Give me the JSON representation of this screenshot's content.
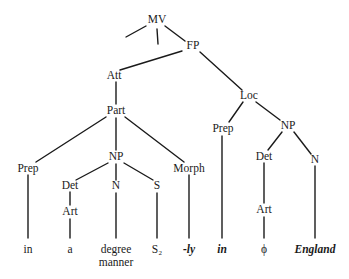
{
  "diagram": {
    "type": "syntax-tree",
    "nodes": {
      "mv": "MV",
      "fp": "FP",
      "att": "Att",
      "part": "Part",
      "loc": "Loc",
      "prep_left": "Prep",
      "np_mid": "NP",
      "morph": "Morph",
      "det_left": "Det",
      "art_left": "Art",
      "n_mid": "N",
      "s_mid": "S",
      "prep_right": "Prep",
      "np_right": "NP",
      "det_right": "Det",
      "n_right": "N",
      "art_right": "Art"
    },
    "leaves": {
      "in_left": "in",
      "a": "a",
      "degree": "degree",
      "manner": "manner",
      "s2": "S₂",
      "ly": "-ly",
      "in_right": "in",
      "phi": "ϕ",
      "england": "England"
    },
    "edges": [
      [
        "MV",
        "(left stub)"
      ],
      [
        "MV",
        "(mid stub)"
      ],
      [
        "MV",
        "FP"
      ],
      [
        "FP",
        "Att"
      ],
      [
        "FP",
        "Loc"
      ],
      [
        "Att",
        "Part"
      ],
      [
        "Part",
        "Prep"
      ],
      [
        "Part",
        "NP"
      ],
      [
        "Part",
        "Morph"
      ],
      [
        "NP",
        "Det"
      ],
      [
        "NP",
        "N"
      ],
      [
        "NP",
        "S"
      ],
      [
        "Det",
        "Art"
      ],
      [
        "Art",
        "a"
      ],
      [
        "Prep",
        "in"
      ],
      [
        "N",
        "degree manner"
      ],
      [
        "S",
        "S₂"
      ],
      [
        "Morph",
        "-ly"
      ],
      [
        "Loc",
        "Prep"
      ],
      [
        "Loc",
        "NP"
      ],
      [
        "Prep",
        "in"
      ],
      [
        "NP",
        "Det"
      ],
      [
        "NP",
        "N"
      ],
      [
        "Det",
        "Art"
      ],
      [
        "Art",
        "ϕ"
      ],
      [
        "N",
        "England"
      ]
    ]
  }
}
